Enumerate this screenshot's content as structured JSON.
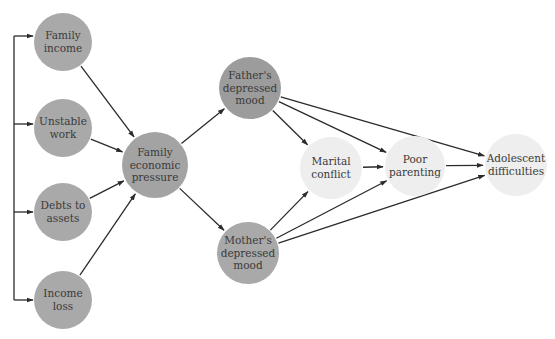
{
  "diagram": {
    "type": "path-model",
    "colors": {
      "input_node": "#a9a9a9",
      "mediator_node": "#a3a3a3",
      "mood_node": "#a0a0a0",
      "outcome_node": "#eeeeee",
      "edge": "#2b2b2b",
      "text": "#3a3a3a"
    },
    "nodes": [
      {
        "id": "family_income",
        "lines": [
          "Family",
          "income"
        ],
        "cx": 63,
        "cy": 42,
        "r": 29,
        "fill": "#a9a9a9"
      },
      {
        "id": "unstable_work",
        "lines": [
          "Unstable",
          "work"
        ],
        "cx": 63,
        "cy": 128,
        "r": 29,
        "fill": "#a9a9a9"
      },
      {
        "id": "debts_to_assets",
        "lines": [
          "Debts to",
          "assets"
        ],
        "cx": 63,
        "cy": 212,
        "r": 29,
        "fill": "#a9a9a9"
      },
      {
        "id": "income_loss",
        "lines": [
          "Income",
          "loss"
        ],
        "cx": 63,
        "cy": 300,
        "r": 29,
        "fill": "#a9a9a9"
      },
      {
        "id": "family_economic_pressure",
        "lines": [
          "Family",
          "economic",
          "pressure"
        ],
        "cx": 155,
        "cy": 165,
        "r": 33,
        "fill": "#a3a3a3"
      },
      {
        "id": "fathers_depressed_mood",
        "lines": [
          "Father's",
          "depressed",
          "mood"
        ],
        "cx": 250,
        "cy": 88,
        "r": 31,
        "fill": "#9c9c9c"
      },
      {
        "id": "mothers_depressed_mood",
        "lines": [
          "Mother's",
          "depressed",
          "mood"
        ],
        "cx": 248,
        "cy": 253,
        "r": 31,
        "fill": "#a9a9a9"
      },
      {
        "id": "marital_conflict",
        "lines": [
          "Marital",
          "conflict"
        ],
        "cx": 331,
        "cy": 168,
        "r": 31,
        "fill": "#eeeeee"
      },
      {
        "id": "poor_parenting",
        "lines": [
          "Poor",
          "parenting"
        ],
        "cx": 415,
        "cy": 166,
        "r": 30,
        "fill": "#eeeeee"
      },
      {
        "id": "adolescent_difficulties",
        "lines": [
          "Adolescent",
          "difficulties"
        ],
        "cx": 516,
        "cy": 165,
        "r": 31,
        "fill": "#eeeeee"
      }
    ],
    "bracket": {
      "x": 14,
      "y_top": 36,
      "y_bottom": 300,
      "arrow_targets_y": [
        36,
        124,
        212,
        300
      ],
      "arrow_end_x": 33
    },
    "edges": [
      {
        "from": "family_income",
        "to": "family_economic_pressure"
      },
      {
        "from": "unstable_work",
        "to": "family_economic_pressure"
      },
      {
        "from": "debts_to_assets",
        "to": "family_economic_pressure"
      },
      {
        "from": "income_loss",
        "to": "family_economic_pressure"
      },
      {
        "from": "family_economic_pressure",
        "to": "fathers_depressed_mood"
      },
      {
        "from": "family_economic_pressure",
        "to": "mothers_depressed_mood"
      },
      {
        "from": "fathers_depressed_mood",
        "to": "marital_conflict"
      },
      {
        "from": "fathers_depressed_mood",
        "to": "poor_parenting"
      },
      {
        "from": "fathers_depressed_mood",
        "to": "adolescent_difficulties"
      },
      {
        "from": "mothers_depressed_mood",
        "to": "marital_conflict"
      },
      {
        "from": "mothers_depressed_mood",
        "to": "poor_parenting"
      },
      {
        "from": "mothers_depressed_mood",
        "to": "adolescent_difficulties"
      },
      {
        "from": "marital_conflict",
        "to": "poor_parenting"
      },
      {
        "from": "poor_parenting",
        "to": "adolescent_difficulties"
      }
    ]
  }
}
